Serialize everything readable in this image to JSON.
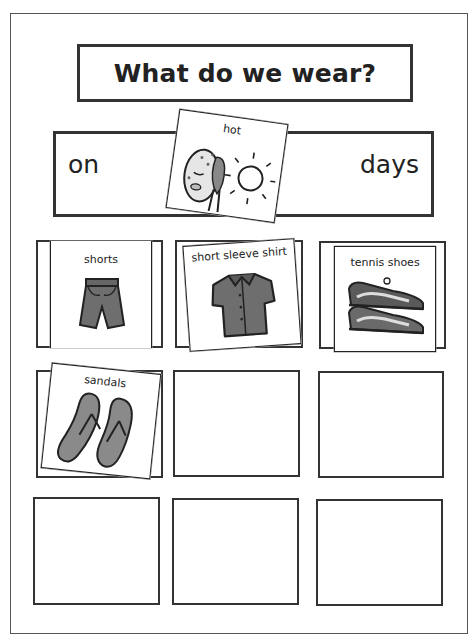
{
  "page": {
    "title": "What do we wear?"
  },
  "sentence": {
    "prefix": "on",
    "suffix": "days",
    "weather_card": {
      "label": "hot",
      "icon": "hot-weather-icon"
    }
  },
  "grid": {
    "rows": 3,
    "cols": 3,
    "cards": [
      {
        "label": "shorts",
        "icon": "shorts-icon"
      },
      {
        "label": "short sleeve shirt",
        "icon": "shirt-icon"
      },
      {
        "label": "tennis shoes",
        "icon": "tennis-shoes-icon"
      },
      {
        "label": "sandals",
        "icon": "sandals-icon"
      }
    ],
    "empty_slots": 5
  },
  "colors": {
    "border": "#333333",
    "fill_gray": "#8a8a8a",
    "fill_dark": "#5a5a5a",
    "text": "#222222"
  }
}
